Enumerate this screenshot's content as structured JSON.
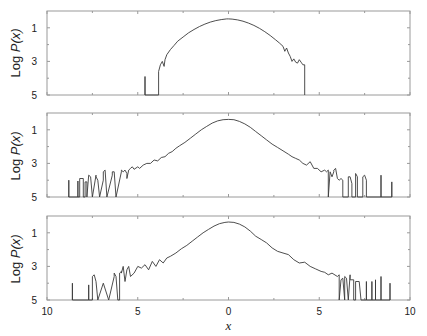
{
  "chart_data": [
    {
      "type": "line",
      "panel": "top",
      "title": "",
      "xlabel": "",
      "ylabel": "Log P(x)",
      "xlim": [
        -10,
        10
      ],
      "ylim": [
        5,
        0
      ],
      "yticks": [
        1,
        3,
        5
      ],
      "xticks": [
        -10,
        -5,
        0,
        5,
        10
      ],
      "grid": false,
      "series": [
        {
          "name": "distribution",
          "x": [
            -4.6,
            -4.6,
            -4.6,
            -3.85,
            -3.85,
            -3.75,
            -3.65,
            -3.55,
            -3.5,
            -3.4,
            -3.2,
            -3.0,
            -2.8,
            -2.5,
            -2.2,
            -1.9,
            -1.6,
            -1.3,
            -1.0,
            -0.7,
            -0.4,
            -0.1,
            0.0,
            0.2,
            0.5,
            0.8,
            1.1,
            1.4,
            1.7,
            2.0,
            2.3,
            2.6,
            2.8,
            3.0,
            3.1,
            3.2,
            3.3,
            3.4,
            3.5,
            3.6,
            3.7,
            3.8,
            3.9,
            4.0,
            4.1,
            4.2,
            4.2
          ],
          "y": [
            5.0,
            3.9,
            5.0,
            5.0,
            3.6,
            3.2,
            3.0,
            3.3,
            2.9,
            2.6,
            2.3,
            2.05,
            1.8,
            1.55,
            1.3,
            1.1,
            0.92,
            0.78,
            0.66,
            0.57,
            0.51,
            0.47,
            0.47,
            0.48,
            0.53,
            0.61,
            0.72,
            0.86,
            1.03,
            1.23,
            1.46,
            1.72,
            1.9,
            2.1,
            2.4,
            2.2,
            2.5,
            2.7,
            3.0,
            2.85,
            3.05,
            3.1,
            2.9,
            3.05,
            3.2,
            3.2,
            5.0
          ]
        }
      ]
    },
    {
      "type": "line",
      "panel": "middle",
      "title": "",
      "xlabel": "",
      "ylabel": "Log P(x)",
      "xlim": [
        -10,
        10
      ],
      "ylim": [
        5,
        0
      ],
      "yticks": [
        1,
        3,
        5
      ],
      "xticks": [
        -10,
        -5,
        0,
        5,
        10
      ],
      "grid": false,
      "series": [
        {
          "name": "distribution",
          "x": [
            -8.8,
            -8.8,
            -8.8,
            -8.3,
            -8.3,
            -8.3,
            -8.2,
            -8.2,
            -8.0,
            -8.0,
            -7.9,
            -7.9,
            -7.8,
            -7.8,
            -7.7,
            -7.6,
            -7.5,
            -7.5,
            -7.3,
            -7.3,
            -7.2,
            -7.1,
            -7.1,
            -6.9,
            -6.9,
            -6.8,
            -6.7,
            -6.7,
            -6.4,
            -6.4,
            -6.3,
            -6.2,
            -6.2,
            -5.9,
            -5.9,
            -5.8,
            -5.7,
            -5.6,
            -5.6,
            -5.5,
            -5.4,
            -5.3,
            -5.2,
            -5.0,
            -4.9,
            -4.7,
            -4.5,
            -4.3,
            -4.1,
            -3.9,
            -3.7,
            -3.5,
            -3.3,
            -3.1,
            -2.9,
            -2.7,
            -2.4,
            -2.1,
            -1.8,
            -1.5,
            -1.2,
            -0.9,
            -0.6,
            -0.3,
            0.0,
            0.3,
            0.6,
            0.9,
            1.2,
            1.5,
            1.8,
            2.1,
            2.4,
            2.7,
            3.0,
            3.3,
            3.5,
            3.7,
            3.9,
            4.1,
            4.3,
            4.5,
            4.7,
            4.9,
            5.1,
            5.3,
            5.4,
            5.5,
            5.5,
            5.6,
            5.7,
            5.8,
            5.8,
            5.9,
            6.0,
            6.1,
            6.2,
            6.3,
            6.3,
            6.6,
            6.6,
            6.7,
            6.8,
            6.8,
            7.0,
            7.0,
            7.1,
            7.1,
            7.4,
            7.4,
            7.5,
            7.6,
            7.6,
            8.4,
            8.4,
            8.4,
            9.0,
            9.0,
            9.0
          ],
          "y": [
            5.0,
            4.0,
            5.0,
            5.0,
            4.05,
            5.0,
            5.0,
            3.9,
            3.9,
            5.0,
            5.0,
            4.1,
            4.1,
            5.0,
            3.7,
            3.8,
            5.0,
            5.0,
            3.7,
            3.8,
            4.0,
            5.0,
            5.0,
            4.0,
            3.5,
            3.4,
            5.0,
            5.0,
            3.7,
            3.5,
            3.5,
            5.0,
            5.0,
            3.5,
            3.4,
            3.5,
            3.4,
            3.6,
            3.9,
            3.4,
            3.3,
            3.2,
            3.35,
            3.2,
            3.3,
            3.1,
            3.0,
            3.0,
            2.8,
            2.85,
            2.65,
            2.6,
            2.4,
            2.3,
            2.1,
            1.95,
            1.75,
            1.5,
            1.25,
            1.0,
            0.8,
            0.6,
            0.47,
            0.4,
            0.38,
            0.4,
            0.5,
            0.65,
            0.85,
            1.1,
            1.35,
            1.6,
            1.85,
            2.05,
            2.25,
            2.45,
            2.6,
            2.7,
            2.8,
            3.0,
            3.1,
            2.9,
            3.3,
            3.3,
            3.5,
            3.4,
            3.5,
            3.4,
            5.0,
            3.5,
            3.8,
            3.5,
            3.4,
            3.3,
            3.9,
            4.0,
            3.9,
            4.0,
            5.0,
            5.0,
            3.8,
            3.8,
            4.2,
            5.0,
            5.0,
            3.6,
            3.8,
            5.0,
            5.0,
            3.8,
            3.7,
            4.0,
            5.0,
            5.0,
            3.7,
            5.0,
            5.0,
            4.1,
            5.0
          ]
        }
      ]
    },
    {
      "type": "line",
      "panel": "bottom",
      "title": "",
      "xlabel": "x",
      "ylabel": "Log P(x)",
      "xlim": [
        -10,
        10
      ],
      "ylim": [
        5,
        0
      ],
      "yticks": [
        1,
        3,
        5
      ],
      "xticks": [
        -10,
        -5,
        0,
        5,
        10
      ],
      "xticklabels": [
        "10",
        "5",
        "0",
        "5",
        "10"
      ],
      "grid": false,
      "series": [
        {
          "name": "distribution",
          "x": [
            -8.6,
            -8.6,
            -8.6,
            -7.7,
            -7.7,
            -7.7,
            -7.5,
            -7.5,
            -7.4,
            -7.3,
            -7.2,
            -7.2,
            -6.9,
            -6.9,
            -6.6,
            -6.6,
            -6.3,
            -6.3,
            -6.2,
            -6.1,
            -6.0,
            -6.0,
            -5.9,
            -5.9,
            -5.8,
            -5.7,
            -5.6,
            -5.5,
            -5.4,
            -5.2,
            -5.0,
            -4.8,
            -4.6,
            -4.4,
            -4.2,
            -4.0,
            -3.8,
            -3.6,
            -3.4,
            -3.2,
            -2.9,
            -2.6,
            -2.3,
            -2.0,
            -1.7,
            -1.4,
            -1.1,
            -0.8,
            -0.5,
            -0.2,
            0.0,
            0.3,
            0.6,
            0.9,
            1.2,
            1.5,
            1.8,
            2.1,
            2.4,
            2.7,
            3.0,
            3.3,
            3.6,
            3.9,
            4.2,
            4.5,
            4.8,
            5.1,
            5.3,
            5.5,
            5.7,
            6.0,
            6.1,
            6.1,
            6.2,
            6.3,
            6.4,
            6.4,
            6.5,
            6.6,
            6.7,
            6.7,
            6.9,
            6.9,
            7.0,
            7.0,
            7.2,
            7.3,
            7.3,
            7.6,
            7.6,
            7.6,
            7.9,
            7.9,
            7.9,
            8.1,
            8.1,
            8.1,
            8.4,
            8.4,
            8.4,
            8.9,
            8.9,
            8.9
          ],
          "y": [
            5.0,
            4.0,
            5.0,
            5.0,
            4.1,
            5.0,
            5.0,
            3.6,
            3.5,
            3.9,
            5.0,
            5.0,
            4.0,
            4.0,
            5.0,
            5.0,
            3.6,
            3.4,
            3.6,
            5.0,
            5.0,
            3.4,
            3.3,
            3.4,
            3.0,
            3.9,
            3.2,
            3.0,
            3.6,
            3.4,
            3.0,
            3.1,
            2.9,
            3.2,
            2.7,
            3.0,
            2.6,
            2.8,
            2.5,
            2.4,
            2.2,
            1.95,
            1.75,
            1.5,
            1.25,
            1.0,
            0.8,
            0.6,
            0.46,
            0.38,
            0.36,
            0.38,
            0.48,
            0.65,
            0.9,
            1.2,
            1.4,
            1.6,
            1.9,
            2.1,
            2.2,
            2.3,
            2.6,
            2.8,
            2.75,
            3.0,
            3.15,
            3.3,
            3.35,
            3.5,
            3.4,
            3.6,
            3.5,
            5.0,
            3.8,
            3.7,
            5.0,
            3.6,
            3.7,
            5.0,
            3.5,
            3.8,
            3.8,
            5.0,
            5.0,
            3.9,
            3.9,
            5.0,
            5.0,
            5.0,
            3.9,
            5.0,
            5.0,
            3.9,
            5.0,
            5.0,
            3.8,
            5.0,
            5.0,
            3.6,
            5.0,
            5.0,
            4.0,
            5.0
          ]
        }
      ]
    }
  ],
  "labels": {
    "ylabel": "Log P(x)",
    "ylabel_prefix": "Log ",
    "ylabel_var": "P(x)",
    "xlabel": "x",
    "yticks": [
      "1",
      "3",
      "5"
    ],
    "xticks": [
      "10",
      "5",
      "0",
      "5",
      "10"
    ]
  },
  "colors": {
    "line": "#3a3a3a",
    "frame": "#9a9a9a",
    "text": "#222222"
  }
}
